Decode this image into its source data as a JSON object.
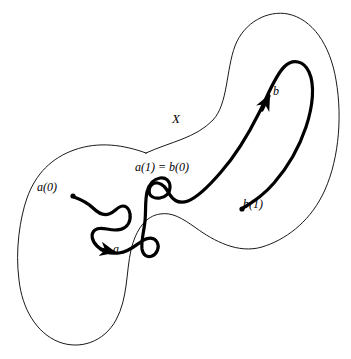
{
  "figure": {
    "space_label": "X",
    "labels": {
      "path_a_start": "a(0)",
      "path_a_name": "a",
      "junction": "a(1) = b(0)",
      "path_b_name": "b",
      "path_b_end": "b(1)"
    },
    "colors": {
      "background": "#ffffff",
      "ink": "#000000",
      "outline": "#1a1a1a"
    },
    "strokes": {
      "blob_outline_width": 1,
      "path_width": 3.2
    }
  }
}
